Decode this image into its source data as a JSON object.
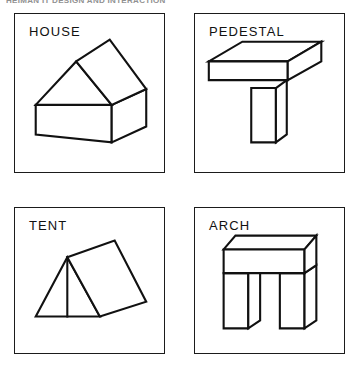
{
  "page": {
    "scan_header_text": "HEIMAN IT DESIGN AND INTERACTION",
    "background_color": "#ffffff",
    "ink_color": "#111111",
    "border_color": "#1b1b1b"
  },
  "panels": [
    {
      "id": "house",
      "label": "HOUSE",
      "figure_name": "house-wireframe-drawing",
      "description": "Isometric line drawing of a house: rectangular box body with a pitched gable roof"
    },
    {
      "id": "pedestal",
      "label": "PEDESTAL",
      "figure_name": "pedestal-wireframe-drawing",
      "description": "Isometric line drawing of a pedestal: flat slab top supported by a single square column"
    },
    {
      "id": "tent",
      "label": "TENT",
      "figure_name": "tent-wireframe-drawing",
      "description": "Isometric line drawing of a tent: triangular front face with a sloping rectangular side panel"
    },
    {
      "id": "arch",
      "label": "ARCH",
      "figure_name": "arch-wireframe-drawing",
      "description": "Isometric line drawing of an arch: horizontal lintel slab resting on two vertical posts"
    }
  ]
}
